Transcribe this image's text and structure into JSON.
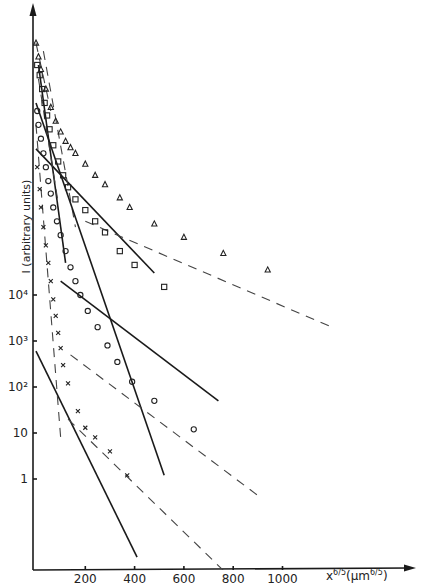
{
  "chart_data": {
    "type": "scatter",
    "title": "",
    "xlabel": "x^{6/5} (µm^{6/5})",
    "ylabel": "I (arbitrary units)",
    "xscale": "linear",
    "yscale": "log",
    "xlim": [
      0,
      1200
    ],
    "x_ticks": [
      200,
      400,
      600,
      800,
      1000
    ],
    "x_tick_labels": [
      "200",
      "400",
      "600",
      "800",
      "1000"
    ],
    "y_ticks": [
      1,
      10,
      100,
      1000,
      10000
    ],
    "y_tick_labels": [
      "1",
      "10",
      "10²",
      "10³",
      "10⁴"
    ],
    "grid": false,
    "legend": "none",
    "series": [
      {
        "name": "triangles",
        "marker": "triangle",
        "points": [
          [
            0,
            3000000000.0
          ],
          [
            10,
            1500000000.0
          ],
          [
            20,
            800000000.0
          ],
          [
            40,
            300000000.0
          ],
          [
            60,
            120000000.0
          ],
          [
            80,
            60000000.0
          ],
          [
            100,
            35000000.0
          ],
          [
            120,
            22000000.0
          ],
          [
            140,
            16000000.0
          ],
          [
            160,
            12000000.0
          ],
          [
            200,
            7000000.0
          ],
          [
            240,
            4000000.0
          ],
          [
            280,
            2500000.0
          ],
          [
            340,
            1300000.0
          ],
          [
            380,
            800000.0
          ],
          [
            480,
            350000.0
          ],
          [
            600,
            180000.0
          ],
          [
            760,
            80000.0
          ],
          [
            940,
            35000.0
          ]
        ],
        "fits": [
          {
            "style": "solid",
            "from": [
              0,
              15000000.0
            ],
            "to": [
              480,
              30000.0
            ]
          },
          {
            "style": "dashed",
            "from": [
              0,
              3000000000.0
            ],
            "to": [
              60,
              100000000.0
            ]
          },
          {
            "style": "dashed",
            "from": [
              200,
              400000.0
            ],
            "to": [
              1200,
              2000.0
            ]
          }
        ]
      },
      {
        "name": "squares",
        "marker": "square",
        "points": [
          [
            5,
            1000000000.0
          ],
          [
            15,
            600000000.0
          ],
          [
            25,
            300000000.0
          ],
          [
            35,
            150000000.0
          ],
          [
            45,
            80000000.0
          ],
          [
            55,
            40000000.0
          ],
          [
            70,
            18000000.0
          ],
          [
            90,
            8000000.0
          ],
          [
            110,
            4000000.0
          ],
          [
            130,
            2200000.0
          ],
          [
            160,
            1200000.0
          ],
          [
            200,
            700000.0
          ],
          [
            240,
            400000.0
          ],
          [
            280,
            230000.0
          ],
          [
            340,
            90000.0
          ],
          [
            400,
            45000.0
          ],
          [
            520,
            15000.0
          ]
        ],
        "fits": [
          {
            "style": "solid",
            "from": [
              10,
              1000000000.0
            ],
            "to": [
              120,
              50000.0
            ]
          },
          {
            "style": "solid",
            "from": [
              100,
              20000.0
            ],
            "to": [
              740,
              50.0
            ]
          },
          {
            "style": "dashed",
            "from": [
              30,
              2000000000.0
            ],
            "to": [
              160,
              300000.0
            ]
          }
        ]
      },
      {
        "name": "circles",
        "marker": "circle",
        "points": [
          [
            5,
            100000000.0
          ],
          [
            10,
            50000000.0
          ],
          [
            20,
            25000000.0
          ],
          [
            30,
            12000000.0
          ],
          [
            40,
            6000000.0
          ],
          [
            50,
            3000000.0
          ],
          [
            60,
            1600000.0
          ],
          [
            70,
            800000.0
          ],
          [
            85,
            400000.0
          ],
          [
            100,
            200000.0
          ],
          [
            120,
            90000.0
          ],
          [
            140,
            40000.0
          ],
          [
            160,
            20000.0
          ],
          [
            180,
            10000.0
          ],
          [
            210,
            4500.0
          ],
          [
            250,
            2000.0
          ],
          [
            290,
            800.0
          ],
          [
            330,
            350.0
          ],
          [
            390,
            130.0
          ],
          [
            480,
            50.0
          ],
          [
            640,
            12.0
          ]
        ],
        "fits": [
          {
            "style": "solid",
            "from": [
              0,
              150000000.0
            ],
            "to": [
              520,
              1.2
            ]
          },
          {
            "style": "dashed",
            "from": [
              140,
              500.0
            ],
            "to": [
              910,
              0.4
            ]
          },
          {
            "style": "dashed",
            "from": [
              10,
              500000000.0
            ],
            "to": [
              90,
              1000000.0
            ]
          }
        ]
      },
      {
        "name": "crosses",
        "marker": "cross",
        "points": [
          [
            5,
            6000000.0
          ],
          [
            15,
            2000000.0
          ],
          [
            20,
            800000.0
          ],
          [
            30,
            300000.0
          ],
          [
            40,
            120000.0
          ],
          [
            50,
            50000.0
          ],
          [
            60,
            20000.0
          ],
          [
            70,
            8000.0
          ],
          [
            80,
            3500.0
          ],
          [
            90,
            1500.0
          ],
          [
            100,
            700.0
          ],
          [
            110,
            300.0
          ],
          [
            130,
            120.0
          ],
          [
            170,
            30.0
          ],
          [
            200,
            13.0
          ],
          [
            240,
            8
          ],
          [
            300,
            4
          ],
          [
            370,
            1.2
          ]
        ],
        "fits": [
          {
            "style": "solid",
            "from": [
              0,
              600.0
            ],
            "to": [
              410,
              0.02
            ]
          },
          {
            "style": "dashed",
            "from": [
              0,
              50000000.0
            ],
            "to": [
              100,
              8
            ]
          },
          {
            "style": "dashed",
            "from": [
              130,
              20.0
            ],
            "to": [
              820,
              0.005
            ]
          }
        ]
      }
    ]
  },
  "axes": {
    "ylabel": "I (arbitrary units)",
    "xlabel_main": "x",
    "xlabel_exp": "6/5",
    "xlabel_unit_open": "(µm",
    "xlabel_unit_exp": "6/5",
    "xlabel_unit_close": ")"
  }
}
